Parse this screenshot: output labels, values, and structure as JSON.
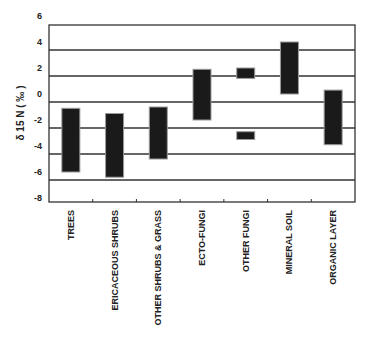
{
  "chart_data": {
    "type": "bar",
    "subtype": "floating-range",
    "title": "",
    "xlabel": "",
    "ylabel": "δ 15 N ( ‰ )",
    "ylim": [
      -8,
      6
    ],
    "yticks": [
      6,
      4,
      2,
      0,
      -2,
      -4,
      -6,
      -8
    ],
    "grid": true,
    "legend": null,
    "categories": [
      "TREES",
      "ERICACEOUS SHRUBS",
      "OTHER SHRUBS & GRASS",
      "ECTO-FUNGI",
      "OTHER FUNGI",
      "MINERAL SOIL",
      "ORGANIC LAYER"
    ],
    "ranges": [
      {
        "category": "TREES",
        "boxes": [
          {
            "low": -6.0,
            "high": -1.1
          }
        ]
      },
      {
        "category": "ERICACEOUS SHRUBS",
        "boxes": [
          {
            "low": -6.4,
            "high": -1.5
          }
        ]
      },
      {
        "category": "OTHER SHRUBS & GRASS",
        "boxes": [
          {
            "low": -5.0,
            "high": -1.0
          }
        ]
      },
      {
        "category": "ECTO-FUNGI",
        "boxes": [
          {
            "low": -2.0,
            "high": 1.9
          }
        ]
      },
      {
        "category": "OTHER FUNGI",
        "boxes": [
          {
            "low": 1.2,
            "high": 2.0
          },
          {
            "low": -3.5,
            "high": -2.9
          }
        ]
      },
      {
        "category": "MINERAL SOIL",
        "boxes": [
          {
            "low": 0.0,
            "high": 4.0
          }
        ]
      },
      {
        "category": "ORGANIC LAYER",
        "boxes": [
          {
            "low": -3.9,
            "high": 0.3
          }
        ]
      }
    ],
    "colors": {
      "bar": "#1a1a1a",
      "bar_outline": "#9a9a9a",
      "grid": "#333333",
      "frame": "#333333"
    }
  }
}
